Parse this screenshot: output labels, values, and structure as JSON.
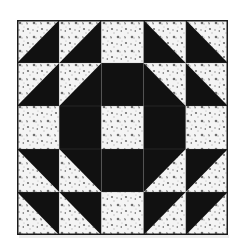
{
  "image": {
    "subject": "quilt-block",
    "grid_size": 5,
    "colors": {
      "dark": "#111111",
      "print_base": "#f4f4f4",
      "print_motif": "#6e6e6e",
      "print_motif_light": "#b5b5b5",
      "border": "#1a1a1a"
    },
    "cells": [
      [
        "hst-print-tl",
        "hst-print-tl",
        "print",
        "hst-print-tr",
        "hst-print-tr"
      ],
      [
        "hst-print-tl",
        "hst-print-tl",
        "dark",
        "hst-print-tr",
        "hst-print-tr"
      ],
      [
        "print",
        "dark",
        "print",
        "dark",
        "print"
      ],
      [
        "hst-print-bl",
        "hst-print-bl",
        "dark",
        "hst-print-br",
        "hst-print-br"
      ],
      [
        "hst-print-bl",
        "hst-print-bl",
        "print",
        "hst-print-br",
        "hst-print-br"
      ]
    ]
  }
}
